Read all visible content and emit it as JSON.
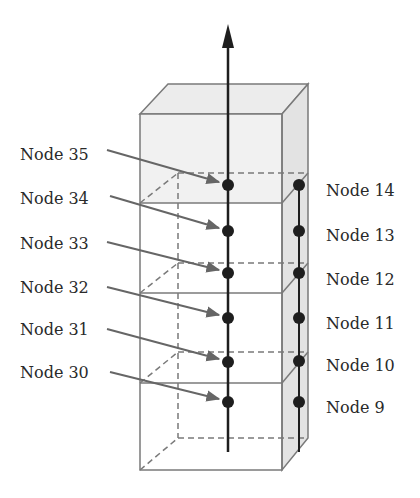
{
  "diagram": {
    "axis_arrow": "vertical-axis-arrow",
    "left_labels": [
      {
        "text": "Node 35",
        "y": 155,
        "target_y": 185
      },
      {
        "text": "Node 34",
        "y": 199,
        "target_y": 231
      },
      {
        "text": "Node 33",
        "y": 244,
        "target_y": 273
      },
      {
        "text": "Node 32",
        "y": 288,
        "target_y": 318
      },
      {
        "text": "Node 31",
        "y": 330,
        "target_y": 362
      },
      {
        "text": "Node 30",
        "y": 373,
        "target_y": 402
      }
    ],
    "right_labels": [
      {
        "text": "Node 14",
        "y": 191
      },
      {
        "text": "Node 13",
        "y": 236
      },
      {
        "text": "Node 12",
        "y": 280
      },
      {
        "text": "Node 11",
        "y": 324
      },
      {
        "text": "Node 10",
        "y": 366
      },
      {
        "text": "Node 9",
        "y": 408
      }
    ],
    "colors": {
      "box_edge": "#7a7a7a",
      "top_face": "#eaeaea",
      "side_face": "#e2e2e2",
      "upper_front": "#f2f2f2",
      "node": "#1e1e1e",
      "arrow": "#666666"
    }
  }
}
